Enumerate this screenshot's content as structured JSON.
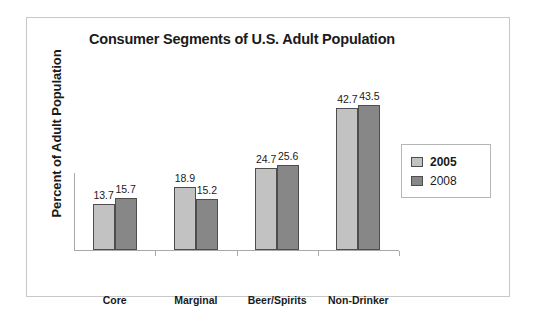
{
  "chart_data": {
    "type": "bar",
    "title": "Consumer Segments of U.S. Adult Population",
    "xlabel": "",
    "ylabel": "Percent of Adult Population",
    "categories": [
      "Core",
      "Marginal",
      "Beer/Spirits",
      "Non-Drinker"
    ],
    "series": [
      {
        "name": "2005",
        "color": "#c2c2c2",
        "values": [
          13.7,
          18.9,
          24.7,
          42.7
        ],
        "labels": [
          "13.7",
          "18.9",
          "24.7",
          "42.7"
        ]
      },
      {
        "name": "2008",
        "color": "#878787",
        "values": [
          15.7,
          15.2,
          25.6,
          43.5
        ],
        "labels": [
          "15.7",
          "15.2",
          "25.6",
          "43.5"
        ]
      }
    ],
    "ylim": [
      0,
      48
    ],
    "grid": false,
    "y_tick_labels": [],
    "legend_position": "right",
    "bar_border_color": "#4d4d4d",
    "axis_color": "#a9a9a9"
  },
  "legend": {
    "items": [
      {
        "label": "2005",
        "bold": true
      },
      {
        "label": "2008",
        "bold": false
      }
    ]
  }
}
